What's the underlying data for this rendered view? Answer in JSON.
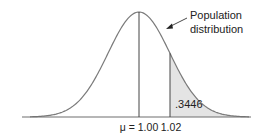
{
  "chart_data": {
    "type": "area",
    "title": "",
    "distribution": "normal",
    "mean": 1.0,
    "annotation_label": "Population distribution",
    "annotation_lines": [
      "Population",
      "distribution"
    ],
    "tick_labels": [
      "μ = 1.00",
      "1.02"
    ],
    "marked_values": [
      1.0,
      1.02
    ],
    "shaded_region": {
      "from": 1.02,
      "to": "+inf",
      "area": 0.3446,
      "label": ".3446"
    },
    "xlabel": "",
    "ylabel": "",
    "grid": false,
    "legend": "none"
  },
  "colors": {
    "curve": "#7a7a7a",
    "axis": "#6e6e6e",
    "shade": "#e4e4e4",
    "text": "#222222"
  }
}
